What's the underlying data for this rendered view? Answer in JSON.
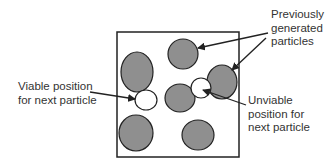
{
  "diagram": {
    "type": "particle-placement",
    "colors": {
      "particle_fill": "#8f8f8f",
      "stroke": "#222222",
      "candidate_fill": "#ffffff"
    },
    "box": {
      "x": 117,
      "y": 32,
      "width": 122,
      "height": 125
    },
    "particles": [
      {
        "cx": 137,
        "cy": 72,
        "rx": 16,
        "ry": 20
      },
      {
        "cx": 183,
        "cy": 54,
        "rx": 15,
        "ry": 15
      },
      {
        "cx": 222,
        "cy": 82,
        "rx": 15,
        "ry": 17
      },
      {
        "cx": 180,
        "cy": 98,
        "rx": 15,
        "ry": 14
      },
      {
        "cx": 136,
        "cy": 133,
        "rx": 17,
        "ry": 18
      },
      {
        "cx": 198,
        "cy": 135,
        "rx": 16,
        "ry": 15
      }
    ],
    "candidates": [
      {
        "name": "viable",
        "cx": 146,
        "cy": 100,
        "rx": 11,
        "ry": 10
      },
      {
        "name": "unviable",
        "cx": 201,
        "cy": 88,
        "rx": 10,
        "ry": 10
      }
    ],
    "labels": {
      "previously_generated": [
        "Previously",
        "generated",
        "particles"
      ],
      "viable": [
        "Viable position",
        "for next particle"
      ],
      "unviable": [
        "Unviable",
        "position for",
        "next particle"
      ]
    }
  }
}
